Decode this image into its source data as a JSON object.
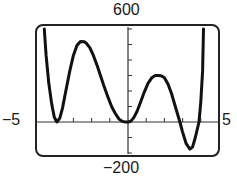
{
  "chart_data": {
    "type": "line",
    "title": "",
    "xlabel": "",
    "ylabel": "",
    "xlim": [
      -5,
      5
    ],
    "ylim": [
      -200,
      600
    ],
    "x_tick_step": 1,
    "y_tick_step": 100,
    "grid": false,
    "legend": null,
    "window_labels": {
      "xmin": "−5",
      "xmax": "5",
      "ymin": "−200",
      "ymax": "600"
    },
    "series": [
      {
        "name": "f(x)",
        "color": "#111111",
        "x": [
          -4.6,
          -4.5,
          -4.35,
          -4.2,
          -4.05,
          -3.9,
          -3.75,
          -3.6,
          -3.4,
          -3.2,
          -3.0,
          -2.8,
          -2.6,
          -2.4,
          -2.3,
          -2.1,
          -1.9,
          -1.7,
          -1.5,
          -1.3,
          -1.1,
          -0.9,
          -0.7,
          -0.5,
          -0.3,
          -0.15,
          0.0,
          0.15,
          0.3,
          0.5,
          0.7,
          0.9,
          1.1,
          1.3,
          1.5,
          1.7,
          1.85,
          2.0,
          2.2,
          2.4,
          2.6,
          2.85,
          3.0,
          3.2,
          3.4,
          3.55,
          3.7,
          3.9,
          4.0,
          4.1,
          4.15
        ],
        "y": [
          600,
          430,
          250,
          120,
          30,
          0,
          25,
          90,
          210,
          330,
          430,
          495,
          520,
          518,
          510,
          480,
          430,
          365,
          295,
          225,
          160,
          100,
          55,
          20,
          4,
          0,
          0,
          5,
          25,
          70,
          130,
          195,
          250,
          285,
          300,
          300,
          297,
          285,
          245,
          180,
          100,
          0,
          -65,
          -140,
          -175,
          -160,
          -100,
          0,
          130,
          330,
          600
        ]
      }
    ]
  },
  "plot_style": {
    "frame_color": "#222222",
    "axis_color": "#333333",
    "curve_color": "#111111",
    "background": "#ffffff"
  }
}
